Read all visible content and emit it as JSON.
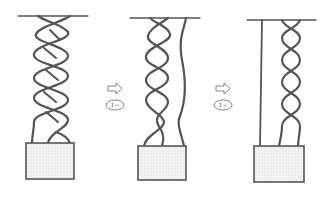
{
  "diagram": {
    "type": "process-sequence",
    "colors": {
      "stroke": "#555555",
      "box_fill": "#f2f2f2",
      "dots": "#b5b5b5",
      "background": "#ffffff"
    },
    "panels": [
      {
        "id": "panel-1",
        "label": "Three strands braided together"
      },
      {
        "id": "panel-2",
        "label": "One strand separated from braid"
      },
      {
        "id": "panel-3",
        "label": "Straight strand plus two-strand twist"
      }
    ],
    "transitions": [
      {
        "arrow": "hollow-right-arrow",
        "step_label": "1−"
      },
      {
        "arrow": "hollow-right-arrow",
        "step_label": "1−"
      }
    ]
  }
}
